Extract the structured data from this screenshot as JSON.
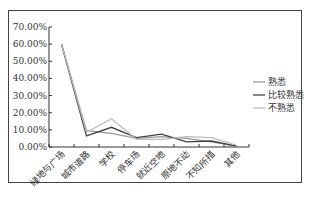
{
  "chart_data": {
    "type": "line",
    "title": "",
    "xlabel": "",
    "ylabel": "",
    "ylim": [
      0,
      70
    ],
    "yticks": [
      "0.00%",
      "10.00%",
      "20.00%",
      "30.00%",
      "40.00%",
      "50.00%",
      "60.00%",
      "70.00%"
    ],
    "categories": [
      "绿地与广场",
      "城市道路",
      "学校",
      "停车场",
      "就近空地",
      "原地不动",
      "不知所措",
      "其他"
    ],
    "series": [
      {
        "name": "熟悉",
        "color": "#999999",
        "values": [
          60,
          9.5,
          8,
          5,
          6,
          5,
          3,
          0.5
        ]
      },
      {
        "name": "比较熟悉",
        "color": "#444444",
        "values": [
          60,
          6.5,
          11.5,
          5.5,
          7.5,
          3,
          3.5,
          0.5
        ]
      },
      {
        "name": "不熟悉",
        "color": "#bbbbbb",
        "values": [
          60,
          8.5,
          16.5,
          4.5,
          4.5,
          6,
          5.5,
          1
        ]
      }
    ],
    "grid": false,
    "legend_position": "right"
  },
  "legend": {
    "items": [
      {
        "label": "熟悉"
      },
      {
        "label": "比较熟悉"
      },
      {
        "label": "不熟悉"
      }
    ]
  }
}
